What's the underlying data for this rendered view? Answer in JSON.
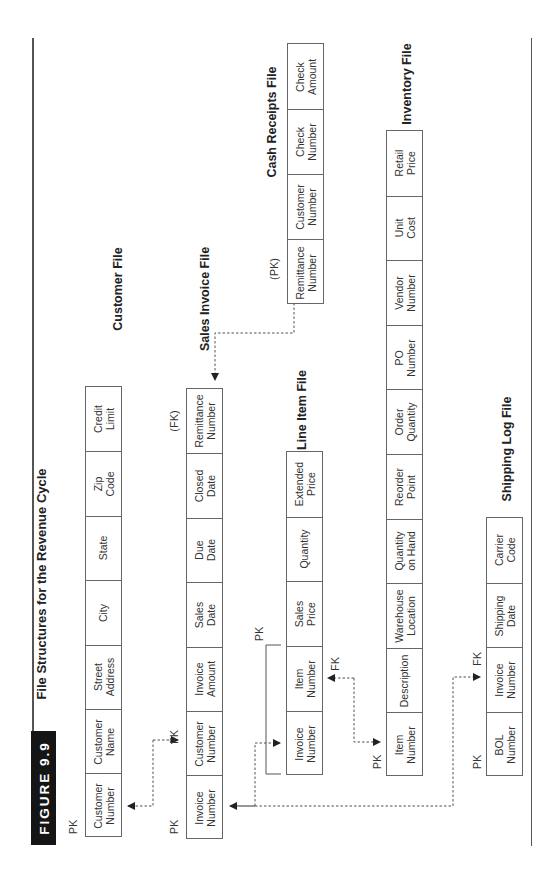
{
  "figure": {
    "label": "FIGURE 9.9",
    "title": "File Structures for the Revenue Cycle"
  },
  "files": {
    "customer": {
      "name": "Customer File",
      "key_labels": [
        "PK"
      ],
      "fields": [
        "Customer\nNumber",
        "Customer\nName",
        "Street\nAddress",
        "City",
        "State",
        "Zip\nCode",
        "Credit\nLimit"
      ]
    },
    "sales_invoice": {
      "name": "Sales Invoice File",
      "key_labels": [
        "PK",
        "FK",
        "(FK)"
      ],
      "fields": [
        "Invoice\nNumber",
        "Customer\nNumber",
        "Invoice\nAmount",
        "Sales\nDate",
        "Due\nDate",
        "Closed\nDate",
        "Remittance\nNumber"
      ]
    },
    "line_item": {
      "name": "Line Item File",
      "key_labels": [
        "PK",
        "FK"
      ],
      "fields": [
        "Invoice\nNumber",
        "Item\nNumber",
        "Sales\nPrice",
        "Quantity",
        "Extended\nPrice"
      ]
    },
    "cash_receipts": {
      "name": "Cash Receipts File",
      "key_labels": [
        "(PK)"
      ],
      "fields": [
        "Remittance\nNumber",
        "Customer\nNumber",
        "Check\nNumber",
        "Check\nAmount"
      ]
    },
    "inventory": {
      "name": "Inventory File",
      "key_labels": [
        "PK"
      ],
      "fields": [
        "Item\nNumber",
        "Description",
        "Warehouse\nLocation",
        "Quantity\non Hand",
        "Reorder\nPoint",
        "Order\nQuantity",
        "PO\nNumber",
        "Vendor\nNumber",
        "Unit\nCost",
        "Retail\nPrice"
      ]
    },
    "shipping_log": {
      "name": "Shipping Log File",
      "key_labels": [
        "PK",
        "FK"
      ],
      "fields": [
        "BOL\nNumber",
        "Invoice\nNumber",
        "Shipping\nDate",
        "Carrier\nCode"
      ]
    }
  },
  "colors": {
    "badge_bg": "#151515",
    "line": "#555555",
    "box_border": "#666666"
  }
}
